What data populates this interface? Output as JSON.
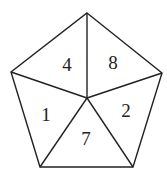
{
  "diagram": {
    "shape": "pentagon",
    "vertices": [
      [
        87,
        13
      ],
      [
        162,
        73
      ],
      [
        133,
        167
      ],
      [
        40,
        167
      ],
      [
        11,
        72
      ]
    ],
    "center": [
      87,
      98
    ],
    "stroke_color": "#222222",
    "regions": [
      {
        "label": "4",
        "x": 67,
        "y": 71
      },
      {
        "label": "8",
        "x": 113,
        "y": 69
      },
      {
        "label": "1",
        "x": 46,
        "y": 121
      },
      {
        "label": "2",
        "x": 126,
        "y": 117
      },
      {
        "label": "7",
        "x": 86,
        "y": 145
      }
    ]
  }
}
